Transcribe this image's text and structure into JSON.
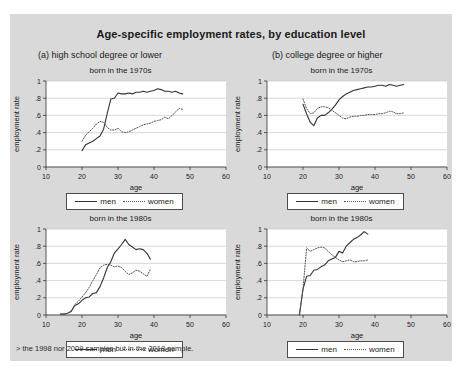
{
  "figure": {
    "title": "Age-specific employment rates, by education level",
    "background_color": "#d9d9d9",
    "plot_background_color": "#ffffff",
    "gridline_color": "#c8c8c8",
    "line_color_men": "#333333",
    "line_color_women": "#555555",
    "panel_a_header": "(a) high school degree or lower",
    "panel_b_header": "(b) college degree or higher",
    "footnote": "> the 1998 nor 2009 samples but in the 2018 sample.",
    "legend": {
      "men": "men",
      "women": "women"
    }
  },
  "chart_data": [
    {
      "id": "a1",
      "type": "line",
      "title": "born in the 1970s",
      "panel": "(a) high school degree or lower",
      "xlabel": "age",
      "ylabel": "employment rate",
      "xlim": [
        10,
        60
      ],
      "ylim": [
        0,
        1
      ],
      "xticks": [
        10,
        20,
        30,
        40,
        50,
        60
      ],
      "yticks": [
        0,
        0.2,
        0.4,
        0.6,
        0.8,
        1
      ],
      "ytick_labels": [
        "0",
        ".2",
        ".4",
        ".6",
        ".8",
        "1"
      ],
      "grid": true,
      "legend_position": "below",
      "series": [
        {
          "name": "men",
          "style": "solid",
          "x": [
            20,
            21,
            22,
            23,
            24,
            25,
            26,
            27,
            28,
            29,
            30,
            31,
            32,
            33,
            34,
            35,
            36,
            37,
            38,
            39,
            40,
            41,
            42,
            43,
            44,
            45,
            46,
            47,
            48
          ],
          "values": [
            0.19,
            0.26,
            0.28,
            0.3,
            0.33,
            0.36,
            0.44,
            0.62,
            0.79,
            0.8,
            0.86,
            0.85,
            0.85,
            0.86,
            0.85,
            0.87,
            0.87,
            0.88,
            0.87,
            0.88,
            0.89,
            0.91,
            0.9,
            0.88,
            0.88,
            0.87,
            0.88,
            0.86,
            0.85
          ]
        },
        {
          "name": "women",
          "style": "dotted",
          "x": [
            20,
            21,
            22,
            23,
            24,
            25,
            26,
            27,
            28,
            29,
            30,
            31,
            32,
            33,
            34,
            35,
            36,
            37,
            38,
            39,
            40,
            41,
            42,
            43,
            44,
            45,
            46,
            47,
            48
          ],
          "values": [
            0.3,
            0.37,
            0.41,
            0.45,
            0.5,
            0.53,
            0.52,
            0.46,
            0.43,
            0.43,
            0.45,
            0.41,
            0.4,
            0.41,
            0.43,
            0.45,
            0.47,
            0.49,
            0.5,
            0.51,
            0.53,
            0.54,
            0.55,
            0.58,
            0.56,
            0.6,
            0.64,
            0.68,
            0.67
          ]
        }
      ]
    },
    {
      "id": "b1",
      "type": "line",
      "title": "born in the 1970s",
      "panel": "(b) college degree or higher",
      "xlabel": "age",
      "ylabel": "employment rate",
      "xlim": [
        10,
        60
      ],
      "ylim": [
        0,
        1
      ],
      "xticks": [
        10,
        20,
        30,
        40,
        50,
        60
      ],
      "yticks": [
        0,
        0.2,
        0.4,
        0.6,
        0.8,
        1
      ],
      "ytick_labels": [
        "0",
        ".2",
        ".4",
        ".6",
        ".8",
        "1"
      ],
      "grid": true,
      "legend_position": "below",
      "series": [
        {
          "name": "men",
          "style": "solid",
          "x": [
            20,
            21,
            22,
            23,
            24,
            25,
            26,
            27,
            28,
            29,
            30,
            31,
            32,
            33,
            34,
            35,
            36,
            37,
            38,
            39,
            40,
            41,
            42,
            43,
            44,
            45,
            46,
            47,
            48
          ],
          "values": [
            0.73,
            0.62,
            0.52,
            0.48,
            0.57,
            0.6,
            0.6,
            0.63,
            0.67,
            0.72,
            0.78,
            0.82,
            0.85,
            0.87,
            0.89,
            0.9,
            0.91,
            0.92,
            0.93,
            0.93,
            0.94,
            0.95,
            0.95,
            0.94,
            0.96,
            0.95,
            0.94,
            0.95,
            0.96
          ]
        },
        {
          "name": "women",
          "style": "dotted",
          "x": [
            20,
            21,
            22,
            23,
            24,
            25,
            26,
            27,
            28,
            29,
            30,
            31,
            32,
            33,
            34,
            35,
            36,
            37,
            38,
            39,
            40,
            41,
            42,
            43,
            44,
            45,
            46,
            47,
            48
          ],
          "values": [
            0.79,
            0.68,
            0.62,
            0.63,
            0.68,
            0.7,
            0.7,
            0.69,
            0.66,
            0.63,
            0.6,
            0.57,
            0.56,
            0.58,
            0.59,
            0.59,
            0.6,
            0.6,
            0.61,
            0.61,
            0.61,
            0.62,
            0.62,
            0.63,
            0.65,
            0.64,
            0.62,
            0.62,
            0.63
          ]
        }
      ]
    },
    {
      "id": "a2",
      "type": "line",
      "title": "born in the 1980s",
      "panel": "(a) high school degree or lower",
      "xlabel": "age",
      "ylabel": "employment rate",
      "xlim": [
        10,
        60
      ],
      "ylim": [
        0,
        1
      ],
      "xticks": [
        10,
        20,
        30,
        40,
        50,
        60
      ],
      "yticks": [
        0,
        0.2,
        0.4,
        0.6,
        0.8,
        1
      ],
      "ytick_labels": [
        "0",
        ".2",
        ".4",
        ".6",
        ".8",
        "1"
      ],
      "grid": true,
      "legend_position": "below",
      "series": [
        {
          "name": "men",
          "style": "solid",
          "x": [
            14,
            15,
            16,
            17,
            18,
            19,
            20,
            21,
            22,
            23,
            24,
            25,
            26,
            27,
            28,
            29,
            30,
            31,
            32,
            33,
            34,
            35,
            36,
            37,
            38,
            39
          ],
          "values": [
            0.01,
            0.01,
            0.02,
            0.04,
            0.11,
            0.13,
            0.17,
            0.2,
            0.21,
            0.25,
            0.26,
            0.33,
            0.43,
            0.55,
            0.62,
            0.72,
            0.77,
            0.82,
            0.88,
            0.82,
            0.79,
            0.76,
            0.77,
            0.76,
            0.72,
            0.65
          ]
        },
        {
          "name": "women",
          "style": "dotted",
          "x": [
            14,
            15,
            16,
            17,
            18,
            19,
            20,
            21,
            22,
            23,
            24,
            25,
            26,
            27,
            28,
            29,
            30,
            31,
            32,
            33,
            34,
            35,
            36,
            37,
            38,
            39
          ],
          "values": [
            0.01,
            0.01,
            0.02,
            0.05,
            0.12,
            0.16,
            0.21,
            0.26,
            0.32,
            0.4,
            0.47,
            0.55,
            0.58,
            0.59,
            0.58,
            0.56,
            0.57,
            0.55,
            0.51,
            0.47,
            0.49,
            0.52,
            0.51,
            0.48,
            0.45,
            0.53
          ]
        }
      ]
    },
    {
      "id": "b2",
      "type": "line",
      "title": "born in the 1980s",
      "panel": "(b) college degree or higher",
      "xlabel": "age",
      "ylabel": "employment rate",
      "xlim": [
        10,
        60
      ],
      "ylim": [
        0,
        1
      ],
      "xticks": [
        10,
        20,
        30,
        40,
        50,
        60
      ],
      "yticks": [
        0,
        0.2,
        0.4,
        0.6,
        0.8,
        1
      ],
      "ytick_labels": [
        "0",
        ".2",
        ".4",
        ".6",
        ".8",
        "1"
      ],
      "grid": true,
      "legend_position": "below",
      "series": [
        {
          "name": "men",
          "style": "solid",
          "x": [
            19,
            20,
            21,
            22,
            23,
            24,
            25,
            26,
            27,
            28,
            29,
            30,
            31,
            32,
            33,
            34,
            35,
            36,
            37,
            38
          ],
          "values": [
            0.0,
            0.3,
            0.45,
            0.46,
            0.52,
            0.53,
            0.56,
            0.58,
            0.63,
            0.65,
            0.67,
            0.74,
            0.72,
            0.8,
            0.84,
            0.88,
            0.9,
            0.93,
            0.97,
            0.94
          ]
        },
        {
          "name": "women",
          "style": "dotted",
          "x": [
            19,
            20,
            21,
            22,
            23,
            24,
            25,
            26,
            27,
            28,
            29,
            30,
            31,
            32,
            33,
            34,
            35,
            36,
            37,
            38
          ],
          "values": [
            0.0,
            0.3,
            0.78,
            0.74,
            0.76,
            0.78,
            0.79,
            0.78,
            0.74,
            0.7,
            0.67,
            0.64,
            0.62,
            0.63,
            0.64,
            0.62,
            0.62,
            0.63,
            0.63,
            0.64
          ]
        }
      ]
    }
  ]
}
